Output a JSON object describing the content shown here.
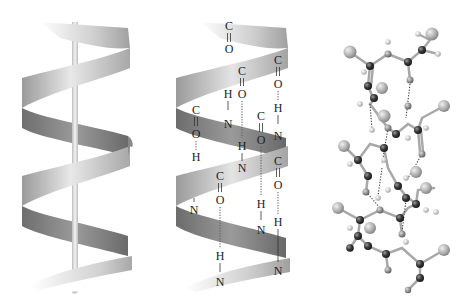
{
  "figure": {
    "panels": [
      {
        "id": "ribbon-with-axis",
        "description": "Ribbon alpha helix with central helix axis rod",
        "footer_mark": "HP"
      },
      {
        "id": "ribbon-with-hbonds",
        "description": "Ribbon alpha helix showing backbone C=O ... H-N hydrogen bonds"
      },
      {
        "id": "ball-and-stick",
        "description": "Ball-and-stick atomic model of alpha helix with dotted hydrogen bonds"
      }
    ],
    "labels": {
      "carbon": "C",
      "oxygen": "O",
      "hydrogen": "H",
      "nitrogen": "N"
    },
    "colors": {
      "ribbon_light": "#e6e6e6",
      "ribbon_mid": "#b8b8b8",
      "ribbon_dark": "#7a7a7a",
      "axis_rod": "#dcdcdc",
      "atom_dark": "#3a3a3a",
      "atom_mid": "#8c8c8c",
      "atom_light": "#c8c8c8",
      "bond": "#9a9a9a",
      "hbond": "#555555",
      "text": "#222222"
    }
  }
}
